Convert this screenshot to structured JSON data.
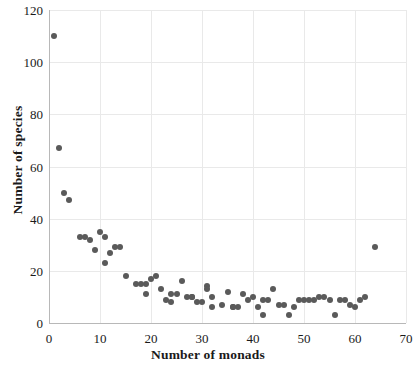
{
  "chart_data": {
    "type": "scatter",
    "title": "",
    "xlabel": "Number of monads",
    "ylabel": "Number of species",
    "xlim": [
      0,
      70
    ],
    "ylim": [
      0,
      120
    ],
    "xticks": [
      0,
      10,
      20,
      30,
      40,
      50,
      60,
      70
    ],
    "yticks": [
      0,
      20,
      40,
      60,
      80,
      100,
      120
    ],
    "grid": true,
    "legend": false,
    "marker_color": "#5a5a5a",
    "series": [
      {
        "name": "species vs monads",
        "points": [
          [
            1,
            110
          ],
          [
            2,
            67
          ],
          [
            3,
            50
          ],
          [
            4,
            47
          ],
          [
            6,
            33
          ],
          [
            7,
            33
          ],
          [
            8,
            32
          ],
          [
            9,
            28
          ],
          [
            10,
            35
          ],
          [
            11,
            33
          ],
          [
            11,
            23
          ],
          [
            12,
            27
          ],
          [
            13,
            29
          ],
          [
            14,
            29
          ],
          [
            15,
            18
          ],
          [
            17,
            15
          ],
          [
            18,
            15
          ],
          [
            19,
            15
          ],
          [
            19,
            11
          ],
          [
            20,
            17
          ],
          [
            21,
            18
          ],
          [
            22,
            13
          ],
          [
            23,
            9
          ],
          [
            24,
            8
          ],
          [
            24,
            11
          ],
          [
            25,
            11
          ],
          [
            26,
            16
          ],
          [
            27,
            10
          ],
          [
            28,
            10
          ],
          [
            28,
            10
          ],
          [
            29,
            8
          ],
          [
            30,
            8
          ],
          [
            31,
            14
          ],
          [
            31,
            13
          ],
          [
            32,
            10
          ],
          [
            32,
            6
          ],
          [
            34,
            7
          ],
          [
            35,
            12
          ],
          [
            36,
            6
          ],
          [
            36,
            6
          ],
          [
            37,
            6
          ],
          [
            38,
            11
          ],
          [
            39,
            9
          ],
          [
            40,
            10
          ],
          [
            41,
            6
          ],
          [
            42,
            9
          ],
          [
            42,
            3
          ],
          [
            43,
            9
          ],
          [
            44,
            13
          ],
          [
            45,
            7
          ],
          [
            46,
            7
          ],
          [
            47,
            3
          ],
          [
            48,
            6
          ],
          [
            49,
            9
          ],
          [
            50,
            9
          ],
          [
            51,
            9
          ],
          [
            52,
            9
          ],
          [
            53,
            10
          ],
          [
            54,
            10
          ],
          [
            55,
            9
          ],
          [
            56,
            3
          ],
          [
            57,
            9
          ],
          [
            58,
            9
          ],
          [
            59,
            7
          ],
          [
            60,
            6
          ],
          [
            61,
            9
          ],
          [
            62,
            10
          ],
          [
            64,
            29
          ]
        ]
      }
    ]
  }
}
